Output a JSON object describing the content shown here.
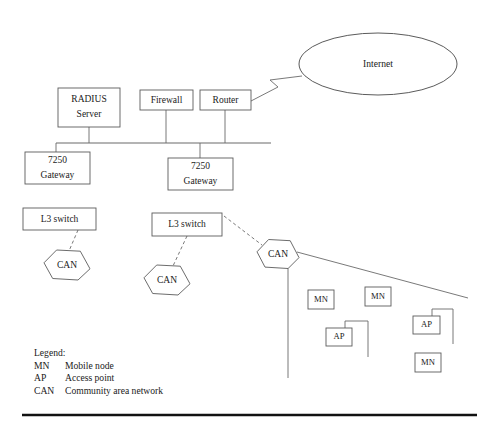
{
  "diagram": {
    "canvas": {
      "width": 489,
      "height": 432
    },
    "stroke_color": "#6a6a6a",
    "text_color": "#1a1a1a",
    "background": "#ffffff",
    "cloud": {
      "label": "Internet",
      "cx": 378,
      "cy": 64,
      "rx": 79,
      "ry": 31
    },
    "boxes": [
      {
        "id": "radius-server",
        "line1": "RADIUS",
        "line2": "Server",
        "x": 58,
        "y": 88,
        "w": 62,
        "h": 39
      },
      {
        "id": "firewall",
        "line1": "Firewall",
        "line2": "",
        "x": 140,
        "y": 90,
        "w": 53,
        "h": 20
      },
      {
        "id": "router",
        "line1": "Router",
        "line2": "",
        "x": 200,
        "y": 90,
        "w": 51,
        "h": 20
      },
      {
        "id": "gateway-left",
        "line1": "7250",
        "line2": "Gateway",
        "x": 25,
        "y": 152,
        "w": 65,
        "h": 32
      },
      {
        "id": "gateway-middle",
        "line1": "7250",
        "line2": "Gateway",
        "x": 168,
        "y": 158,
        "w": 65,
        "h": 32
      },
      {
        "id": "l3-switch-left",
        "line1": "L3 switch",
        "line2": "",
        "x": 23,
        "y": 208,
        "w": 73,
        "h": 22
      },
      {
        "id": "l3-switch-middle",
        "line1": "L3 switch",
        "line2": "",
        "x": 152,
        "y": 213,
        "w": 70,
        "h": 23
      },
      {
        "id": "mobile-node-1",
        "line1": "MN",
        "line2": "",
        "x": 308,
        "y": 290,
        "w": 26,
        "h": 19
      },
      {
        "id": "mobile-node-2",
        "line1": "MN",
        "line2": "",
        "x": 365,
        "y": 287,
        "w": 26,
        "h": 19
      },
      {
        "id": "mobile-node-3",
        "line1": "MN",
        "line2": "",
        "x": 415,
        "y": 353,
        "w": 26,
        "h": 19
      },
      {
        "id": "access-point-1",
        "line1": "AP",
        "line2": "",
        "x": 326,
        "y": 328,
        "w": 26,
        "h": 18
      },
      {
        "id": "access-point-2",
        "line1": "AP",
        "line2": "",
        "x": 413,
        "y": 316,
        "w": 27,
        "h": 18
      }
    ],
    "hexagons": [
      {
        "id": "can-left",
        "label": "CAN",
        "cx": 67,
        "cy": 265,
        "w": 46,
        "h": 30
      },
      {
        "id": "can-middle",
        "label": "CAN",
        "cx": 167,
        "cy": 280,
        "w": 46,
        "h": 30
      },
      {
        "id": "can-right",
        "label": "CAN",
        "cx": 278,
        "cy": 254,
        "w": 42,
        "h": 29
      }
    ],
    "links_solid": [
      {
        "id": "radius-to-bus",
        "x1": 89,
        "y1": 127,
        "x2": 89,
        "y2": 143
      },
      {
        "id": "firewall-to-bus",
        "x1": 166,
        "y1": 110,
        "x2": 166,
        "y2": 143
      },
      {
        "id": "router-to-bus",
        "x1": 225,
        "y1": 110,
        "x2": 225,
        "y2": 143
      },
      {
        "id": "bus-to-gateway-left",
        "x1": 56,
        "y1": 143,
        "x2": 56,
        "y2": 152
      },
      {
        "id": "bus-to-gateway-middle",
        "x1": 200,
        "y1": 143,
        "x2": 200,
        "y2": 158
      },
      {
        "id": "can-right-trunk",
        "x1": 288,
        "y1": 268,
        "x2": 288,
        "y2": 378
      },
      {
        "id": "can-right-diagonal",
        "x1": 297,
        "y1": 252,
        "x2": 468,
        "y2": 298
      },
      {
        "id": "ap1-riser-h",
        "x1": 345,
        "y1": 321,
        "x2": 368,
        "y2": 321
      },
      {
        "id": "ap1-riser-up",
        "x1": 345,
        "y1": 321,
        "x2": 345,
        "y2": 328
      },
      {
        "id": "ap1-riser-down",
        "x1": 368,
        "y1": 321,
        "x2": 368,
        "y2": 357
      },
      {
        "id": "ap2-riser-h",
        "x1": 432,
        "y1": 309,
        "x2": 453,
        "y2": 309
      },
      {
        "id": "ap2-riser-up",
        "x1": 432,
        "y1": 309,
        "x2": 432,
        "y2": 316
      },
      {
        "id": "ap2-riser-down",
        "x1": 453,
        "y1": 309,
        "x2": 453,
        "y2": 344
      }
    ],
    "bus": {
      "id": "backbone-bus",
      "x1": 56,
      "y1": 143,
      "x2": 271,
      "y2": 143
    },
    "links_dashed": [
      {
        "id": "l3-left-to-can-left",
        "x1": 78,
        "y1": 230,
        "x2": 69,
        "y2": 251
      },
      {
        "id": "l3-middle-to-can-middle",
        "x1": 187,
        "y1": 236,
        "x2": 173,
        "y2": 266
      },
      {
        "id": "l3-middle-to-can-right",
        "x1": 224,
        "y1": 216,
        "x2": 262,
        "y2": 245
      }
    ],
    "bolt": {
      "id": "router-to-internet-bolt",
      "points": "251,101 278,87 270,80 302,76"
    },
    "bottom_rule": {
      "x1": 22,
      "y1": 415,
      "x2": 477,
      "y2": 415
    }
  },
  "legend": {
    "title": "Legend:",
    "entries": [
      {
        "abbr": "MN",
        "meaning": "Mobile node"
      },
      {
        "abbr": "AP",
        "meaning": "Access point"
      },
      {
        "abbr": "CAN",
        "meaning": "Community area network"
      }
    ]
  }
}
